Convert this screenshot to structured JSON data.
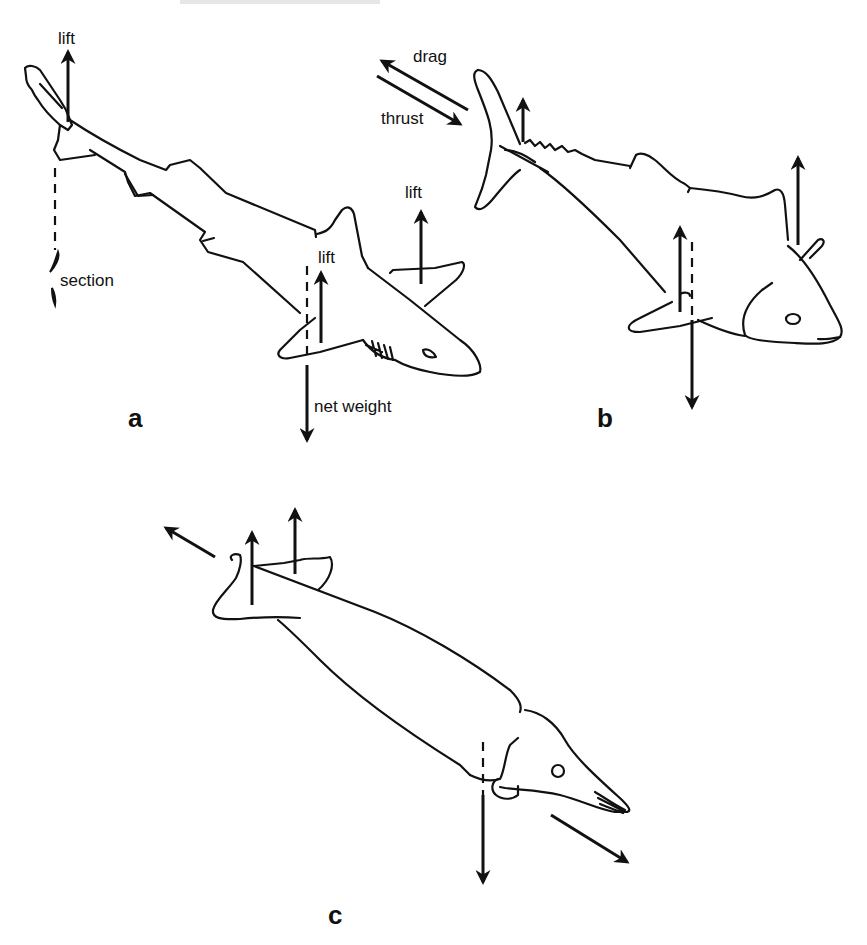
{
  "figure": {
    "header_fragment": "",
    "panels": [
      {
        "id": "a",
        "label": "a",
        "subject": "shark",
        "annotations": {
          "tail_lift": "lift",
          "pectoral_lift": "lift",
          "head_lift": "lift",
          "section": "section",
          "net_weight": "net weight"
        }
      },
      {
        "id": "b",
        "label": "b",
        "subject": "tuna",
        "annotations": {
          "drag": "drag",
          "thrust": "thrust"
        }
      },
      {
        "id": "c",
        "label": "c",
        "subject": "whale",
        "annotations": {}
      }
    ],
    "colors": {
      "ink": "#111111",
      "background": "#ffffff"
    }
  }
}
